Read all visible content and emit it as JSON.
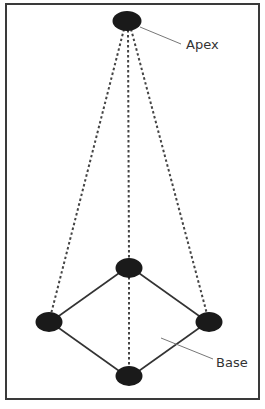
{
  "diagram": {
    "type": "pyramid",
    "labels": {
      "apex": "Apex",
      "base": "Base"
    },
    "nodes": [
      {
        "id": "apex",
        "cx": 127,
        "cy": 21
      },
      {
        "id": "base-back",
        "cx": 129,
        "cy": 268
      },
      {
        "id": "base-left",
        "cx": 49,
        "cy": 322
      },
      {
        "id": "base-right",
        "cx": 209,
        "cy": 322
      },
      {
        "id": "base-front",
        "cx": 129,
        "cy": 376
      }
    ],
    "edges": {
      "solid": [
        [
          "base-back",
          "base-left"
        ],
        [
          "base-back",
          "base-right"
        ],
        [
          "base-left",
          "base-front"
        ],
        [
          "base-right",
          "base-front"
        ]
      ],
      "dashed": [
        [
          "apex",
          "base-left"
        ],
        [
          "apex",
          "base-back"
        ],
        [
          "apex",
          "base-right"
        ],
        [
          "base-back",
          "base-front"
        ]
      ]
    },
    "colors": {
      "node_fill": "#1a1a1a",
      "solid_edge": "#333333",
      "dashed_edge": "#444444",
      "leader_line": "#777777",
      "frame": "#3a3a3a",
      "text": "#333333"
    }
  }
}
